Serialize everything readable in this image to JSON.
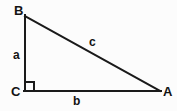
{
  "diagram": {
    "type": "right-triangle",
    "canvas": {
      "width": 177,
      "height": 111
    },
    "colors": {
      "background": "#fcfcfc",
      "stroke": "#1a1a1a",
      "label": "#131313"
    },
    "stroke_width": 2,
    "vertices": [
      {
        "id": "B",
        "label": "B",
        "x": 25,
        "y": 16
      },
      {
        "id": "C",
        "label": "C",
        "x": 25,
        "y": 91
      },
      {
        "id": "A",
        "label": "A",
        "x": 160,
        "y": 91
      }
    ],
    "sides": [
      {
        "id": "a",
        "label": "a",
        "from": "B",
        "to": "C",
        "role": "vertical-leg"
      },
      {
        "id": "b",
        "label": "b",
        "from": "C",
        "to": "A",
        "role": "horizontal-leg"
      },
      {
        "id": "c",
        "label": "c",
        "from": "B",
        "to": "A",
        "role": "hypotenuse"
      }
    ],
    "right_angle_marker": {
      "at_vertex": "C",
      "size": 9
    }
  }
}
